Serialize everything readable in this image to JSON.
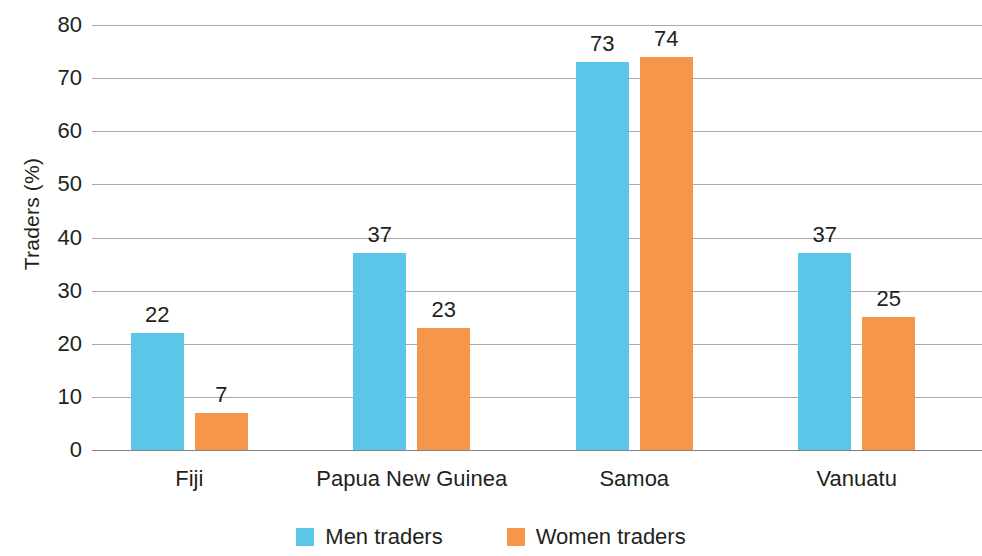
{
  "chart_data": {
    "type": "bar",
    "title": "",
    "xlabel": "",
    "ylabel": "Traders (%)",
    "categories": [
      "Fiji",
      "Papua New Guinea",
      "Samoa",
      "Vanuatu"
    ],
    "series": [
      {
        "name": "Men traders",
        "color": "#5BC6E8",
        "values": [
          22,
          37,
          73,
          37
        ]
      },
      {
        "name": "Women traders",
        "color": "#F5964B",
        "values": [
          7,
          23,
          74,
          25
        ]
      }
    ],
    "ylim": [
      0,
      80
    ],
    "yticks": [
      0,
      10,
      20,
      30,
      40,
      50,
      60,
      70,
      80
    ],
    "ytick_labels": [
      "0",
      "10",
      "20",
      "30",
      "40",
      "50",
      "60",
      "70",
      "80"
    ],
    "grid": true,
    "legend_position": "bottom",
    "value_labels": true,
    "colors": {
      "men": "#5BC6E8",
      "women": "#F5964B",
      "gridline": "#a7a9ac",
      "text": "#231f20",
      "background": "#ffffff"
    }
  }
}
